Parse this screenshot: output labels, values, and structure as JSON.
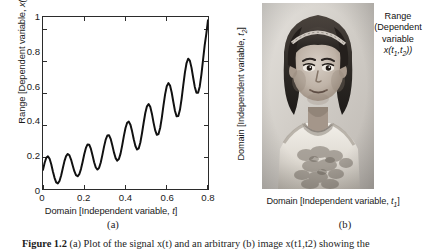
{
  "figure": {
    "caption_label": "Figure 1.2",
    "caption_text": "(a) Plot of the signal x(t) and an arbitrary (b) image x(t1,t2) showing the",
    "sublabel_a": "(a)",
    "sublabel_b": "(b)"
  },
  "panel_a": {
    "xlabel_prefix": "Domain [Independent variable, ",
    "xlabel_var": "t",
    "xlabel_suffix": "]",
    "ylabel_prefix": "Range [Dependent variable, ",
    "ylabel_var": "x(t)",
    "ylabel_suffix": "]",
    "xticks": [
      "0",
      "0.2",
      "0.4",
      "0.6",
      "0.8"
    ],
    "yticks": [
      "0",
      "0.2",
      "0.4",
      "0.6",
      "0.8",
      "1"
    ]
  },
  "panel_b": {
    "xlabel_prefix": "Domain [Independent variable, ",
    "xlabel_var": "t",
    "xlabel_sub": "1",
    "xlabel_suffix": "]",
    "ylabel_prefix": "Domain [Independent variable, ",
    "ylabel_var": "t",
    "ylabel_sub": "2",
    "ylabel_suffix": "]",
    "annotation_line1": "Range",
    "annotation_line2": "(Dependent",
    "annotation_line3": "variable",
    "annotation_line4_var": "x(t",
    "annotation_line4_sub1": "1",
    "annotation_line4_mid": ",t",
    "annotation_line4_sub2": "2",
    "annotation_line4_end": "))",
    "image_description": "grayscale portrait photograph of a young child wearing a headband and a light sleeveless dress"
  },
  "colors": {
    "curve": "#111111",
    "axis": "#2b2b2b",
    "text": "#1a1a1a",
    "background": "#ffffff"
  },
  "chart_data": {
    "type": "line",
    "title": "",
    "xlabel": "Domain [Independent variable, t]",
    "ylabel": "Range [Dependent variable, x(t)]",
    "xlim": [
      0,
      0.8
    ],
    "ylim": [
      0,
      1.08
    ],
    "xticks": [
      0,
      0.2,
      0.4,
      0.6,
      0.8
    ],
    "yticks": [
      0,
      0.2,
      0.4,
      0.6,
      0.8,
      1
    ],
    "grid": false,
    "legend": false,
    "series": [
      {
        "name": "x(t)",
        "color": "#111111",
        "description": "sinusoidal oscillation of period about 0.055 with growing amplitude riding on a rising linear trend",
        "x": [
          0.0,
          0.008,
          0.016,
          0.024,
          0.032,
          0.04,
          0.048,
          0.056,
          0.064,
          0.072,
          0.08,
          0.088,
          0.096,
          0.104,
          0.112,
          0.12,
          0.128,
          0.136,
          0.144,
          0.152,
          0.16,
          0.168,
          0.176,
          0.184,
          0.192,
          0.2,
          0.208,
          0.216,
          0.224,
          0.232,
          0.24,
          0.248,
          0.256,
          0.264,
          0.272,
          0.28,
          0.288,
          0.296,
          0.304,
          0.312,
          0.32,
          0.328,
          0.336,
          0.344,
          0.352,
          0.36,
          0.368,
          0.376,
          0.384,
          0.392,
          0.4,
          0.408,
          0.416,
          0.424,
          0.432,
          0.44,
          0.448,
          0.456,
          0.464,
          0.472,
          0.48,
          0.488,
          0.496,
          0.504,
          0.512,
          0.52,
          0.528,
          0.536,
          0.544,
          0.552,
          0.56,
          0.568,
          0.576,
          0.584,
          0.592,
          0.6,
          0.608,
          0.616,
          0.624,
          0.632,
          0.64,
          0.648,
          0.656,
          0.664,
          0.672,
          0.68,
          0.688,
          0.696,
          0.704,
          0.712,
          0.72,
          0.728,
          0.736,
          0.744,
          0.752,
          0.76,
          0.768,
          0.776,
          0.784,
          0.792,
          0.8
        ],
        "y": [
          0.12,
          0.165,
          0.196,
          0.205,
          0.19,
          0.155,
          0.11,
          0.07,
          0.042,
          0.035,
          0.05,
          0.085,
          0.13,
          0.175,
          0.207,
          0.22,
          0.212,
          0.185,
          0.148,
          0.112,
          0.087,
          0.08,
          0.093,
          0.125,
          0.17,
          0.218,
          0.258,
          0.28,
          0.278,
          0.253,
          0.212,
          0.168,
          0.135,
          0.122,
          0.133,
          0.166,
          0.214,
          0.266,
          0.31,
          0.336,
          0.338,
          0.315,
          0.275,
          0.23,
          0.194,
          0.178,
          0.188,
          0.222,
          0.274,
          0.332,
          0.383,
          0.416,
          0.423,
          0.403,
          0.362,
          0.312,
          0.27,
          0.248,
          0.255,
          0.292,
          0.35,
          0.416,
          0.477,
          0.519,
          0.533,
          0.516,
          0.473,
          0.417,
          0.368,
          0.34,
          0.345,
          0.383,
          0.447,
          0.523,
          0.594,
          0.645,
          0.665,
          0.65,
          0.606,
          0.546,
          0.49,
          0.456,
          0.458,
          0.497,
          0.566,
          0.65,
          0.731,
          0.791,
          0.818,
          0.806,
          0.762,
          0.7,
          0.641,
          0.604,
          0.604,
          0.644,
          0.718,
          0.811,
          0.903,
          0.976,
          1.06
        ]
      }
    ]
  }
}
